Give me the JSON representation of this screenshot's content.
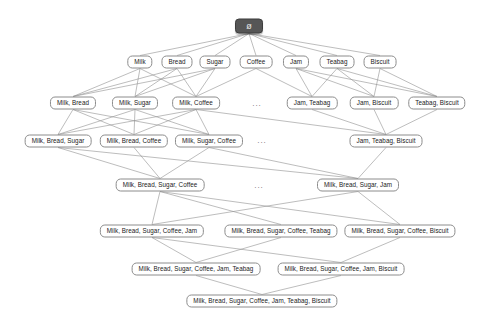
{
  "diagram": {
    "type": "hasse-lattice",
    "background_color": "#ffffff",
    "edge_color": "#909090",
    "node_border_color": "#8c8c8c",
    "node_fill_color": "#ffffff",
    "root_fill_color": "#565656",
    "root_text_color": "#e8e8e8",
    "ellipsis_label": "...",
    "nodes": [
      {
        "id": "empty",
        "label": "ø",
        "level": 0,
        "x": 249,
        "y": 26,
        "root": true
      },
      {
        "id": "M",
        "label": "Milk",
        "level": 1,
        "x": 140,
        "y": 62
      },
      {
        "id": "B",
        "label": "Bread",
        "level": 1,
        "x": 177,
        "y": 62
      },
      {
        "id": "S",
        "label": "Sugar",
        "level": 1,
        "x": 215,
        "y": 62
      },
      {
        "id": "C",
        "label": "Coffee",
        "level": 1,
        "x": 256,
        "y": 62
      },
      {
        "id": "J",
        "label": "Jam",
        "level": 1,
        "x": 296,
        "y": 62
      },
      {
        "id": "T",
        "label": "Teabag",
        "level": 1,
        "x": 337,
        "y": 62
      },
      {
        "id": "K",
        "label": "Biscuit",
        "level": 1,
        "x": 380,
        "y": 62
      },
      {
        "id": "MB",
        "label": "Milk, Bread",
        "level": 2,
        "x": 73,
        "y": 103
      },
      {
        "id": "MS",
        "label": "Milk, Sugar",
        "level": 2,
        "x": 135,
        "y": 103
      },
      {
        "id": "MC",
        "label": "Milk, Coffee",
        "level": 2,
        "x": 196,
        "y": 103
      },
      {
        "id": "JT",
        "label": "Jam, Teabag",
        "level": 2,
        "x": 312,
        "y": 103
      },
      {
        "id": "JK",
        "label": "Jam, Biscuit",
        "level": 2,
        "x": 374,
        "y": 103
      },
      {
        "id": "TK",
        "label": "Teabag, Biscuit",
        "level": 2,
        "x": 437,
        "y": 103
      },
      {
        "id": "MBS",
        "label": "Milk, Bread, Sugar",
        "level": 3,
        "x": 58,
        "y": 141
      },
      {
        "id": "MBC",
        "label": "Milk, Bread, Coffee",
        "level": 3,
        "x": 134,
        "y": 141
      },
      {
        "id": "MSC",
        "label": "Milk, Sugar, Coffee",
        "level": 3,
        "x": 209,
        "y": 141
      },
      {
        "id": "JTK",
        "label": "Jam, Teabag, Biscuit",
        "level": 3,
        "x": 386,
        "y": 141
      },
      {
        "id": "MBSC",
        "label": "Milk, Bread, Sugar, Coffee",
        "level": 4,
        "x": 160,
        "y": 185
      },
      {
        "id": "MBSJ",
        "label": "Milk, Bread, Sugar, Jam",
        "level": 4,
        "x": 358,
        "y": 185
      },
      {
        "id": "MBSCJ",
        "label": "Milk, Bread, Sugar, Coffee, Jam",
        "level": 5,
        "x": 152,
        "y": 231
      },
      {
        "id": "MBSCT",
        "label": "Milk, Bread, Sugar, Coffee, Teabag",
        "level": 5,
        "x": 281,
        "y": 231
      },
      {
        "id": "MBSCK",
        "label": "Milk, Bread, Sugar, Coffee, Biscuit",
        "level": 5,
        "x": 400,
        "y": 231
      },
      {
        "id": "MBSCJT",
        "label": "Milk, Bread, Sugar, Coffee, Jam, Teabag",
        "level": 6,
        "x": 196,
        "y": 269
      },
      {
        "id": "MBSCJK",
        "label": "Milk, Bread, Sugar, Coffee, Jam, Biscuit",
        "level": 6,
        "x": 341,
        "y": 269
      },
      {
        "id": "ALL",
        "label": "Milk, Bread, Sugar, Coffee, Jam, Teabag, Biscuit",
        "level": 7,
        "x": 262,
        "y": 301
      }
    ],
    "ellipses": [
      {
        "id": "ell-l2",
        "x": 257,
        "y": 104
      },
      {
        "id": "ell-l3",
        "x": 262,
        "y": 141
      },
      {
        "id": "ell-l4",
        "x": 259,
        "y": 186
      }
    ],
    "edges": [
      [
        "empty",
        "M"
      ],
      [
        "empty",
        "B"
      ],
      [
        "empty",
        "S"
      ],
      [
        "empty",
        "C"
      ],
      [
        "empty",
        "J"
      ],
      [
        "empty",
        "T"
      ],
      [
        "empty",
        "K"
      ],
      [
        "M",
        "MB"
      ],
      [
        "M",
        "MS"
      ],
      [
        "M",
        "MC"
      ],
      [
        "B",
        "MB"
      ],
      [
        "B",
        "MS"
      ],
      [
        "B",
        "MC"
      ],
      [
        "S",
        "MB"
      ],
      [
        "S",
        "MS"
      ],
      [
        "S",
        "MC"
      ],
      [
        "C",
        "MC"
      ],
      [
        "C",
        "JT"
      ],
      [
        "J",
        "JT"
      ],
      [
        "J",
        "JK"
      ],
      [
        "J",
        "TK"
      ],
      [
        "T",
        "JT"
      ],
      [
        "T",
        "JK"
      ],
      [
        "T",
        "TK"
      ],
      [
        "K",
        "JK"
      ],
      [
        "K",
        "TK"
      ],
      [
        "MB",
        "MBS"
      ],
      [
        "MB",
        "MBC"
      ],
      [
        "MB",
        "MSC"
      ],
      [
        "MS",
        "MBS"
      ],
      [
        "MS",
        "MBC"
      ],
      [
        "MS",
        "MSC"
      ],
      [
        "MC",
        "MBS"
      ],
      [
        "MC",
        "MBC"
      ],
      [
        "MC",
        "MSC"
      ],
      [
        "JT",
        "JTK"
      ],
      [
        "JK",
        "JTK"
      ],
      [
        "TK",
        "JTK"
      ],
      [
        "MC",
        "JTK"
      ],
      [
        "MBS",
        "MBSC"
      ],
      [
        "MBC",
        "MBSC"
      ],
      [
        "MSC",
        "MBSC"
      ],
      [
        "MBS",
        "MBSJ"
      ],
      [
        "MSC",
        "MBSJ"
      ],
      [
        "JTK",
        "MBSJ"
      ],
      [
        "MBSC",
        "MBSCJ"
      ],
      [
        "MBSC",
        "MBSCT"
      ],
      [
        "MBSC",
        "MBSCK"
      ],
      [
        "MBSJ",
        "MBSCJ"
      ],
      [
        "MBSJ",
        "MBSCK"
      ],
      [
        "MBSCJ",
        "MBSCJT"
      ],
      [
        "MBSCT",
        "MBSCJT"
      ],
      [
        "MBSCJ",
        "MBSCJK"
      ],
      [
        "MBSCK",
        "MBSCJK"
      ],
      [
        "MBSCJT",
        "ALL"
      ],
      [
        "MBSCJK",
        "ALL"
      ]
    ]
  }
}
